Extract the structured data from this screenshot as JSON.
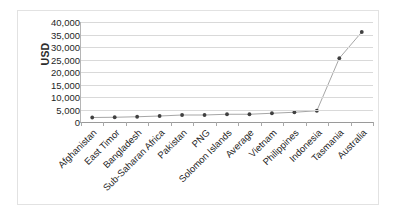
{
  "chart_data": {
    "type": "line",
    "title": "",
    "xlabel": "",
    "ylabel": "USD",
    "ylim": [
      0,
      40000
    ],
    "ytick_step": 5000,
    "grid": true,
    "legend": "none",
    "marker": "circle",
    "categories": [
      "Afghanistan",
      "East Timor",
      "Bangladesh",
      "Sub-Saharan Africa",
      "Pakistan",
      "PNG",
      "Solomon Islands",
      "Average",
      "Vietnam",
      "Philippines",
      "Indonesia",
      "Tasmania",
      "Australia"
    ],
    "values": [
      1800,
      1900,
      2100,
      2400,
      2800,
      2800,
      3100,
      3100,
      3500,
      3900,
      4500,
      25500,
      36000
    ],
    "ytick_labels": [
      "40,000",
      "35,000",
      "30,000",
      "25,000",
      "20,000",
      "15,000",
      "10,000",
      "5,000",
      "0"
    ],
    "ytick_values": [
      40000,
      35000,
      30000,
      25000,
      20000,
      15000,
      10000,
      5000,
      0
    ],
    "colors": {
      "line": "#a6a6a6",
      "marker": "#404040",
      "gridline": "#d9d9d9",
      "axis": "#9a9a9a",
      "text": "#1f1f1f",
      "frame": "#e2e2e2",
      "background": "#ffffff"
    }
  }
}
